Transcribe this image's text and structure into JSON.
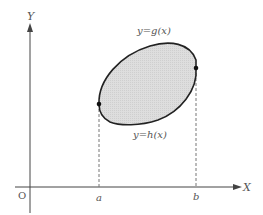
{
  "diagram": {
    "axes": {
      "x_label": "X",
      "y_label": "Y",
      "origin_label": "O"
    },
    "curves": {
      "upper": "y=g(x)",
      "lower": "y=h(x)"
    },
    "bounds": {
      "left": "a",
      "right": "b"
    },
    "colors": {
      "region_fill": "#d9d9d9",
      "curve_stroke": "#222222",
      "axis_stroke": "#444444",
      "dash_stroke": "#777777",
      "label_color": "#555555"
    }
  }
}
